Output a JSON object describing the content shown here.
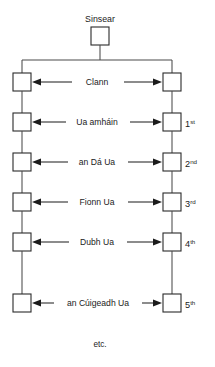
{
  "diagram": {
    "root": {
      "label": "Sinsear",
      "node_name": "ancestor-node"
    },
    "footer": {
      "label": "etc."
    },
    "colors": {
      "background": "#ffffff",
      "box_stroke": "#2a2a2a",
      "box_fill": "#ffffff",
      "connector": "#4a4a4a",
      "arrow": "#1b1b1b",
      "text": "#1b1b1b"
    },
    "rows": [
      {
        "relation": "Clann",
        "ordinal_number": "",
        "ordinal_suffix": "",
        "left_node": "left-node-clann",
        "right_node": "right-node-clann"
      },
      {
        "relation": "Ua amháin",
        "ordinal_number": "1",
        "ordinal_suffix": "st",
        "left_node": "left-node-ua-amhain",
        "right_node": "right-node-ua-amhain"
      },
      {
        "relation": "an Dá Ua",
        "ordinal_number": "2",
        "ordinal_suffix": "nd",
        "left_node": "left-node-an-da-ua",
        "right_node": "right-node-an-da-ua"
      },
      {
        "relation": "Fionn Ua",
        "ordinal_number": "3",
        "ordinal_suffix": "rd",
        "left_node": "left-node-fionn-ua",
        "right_node": "right-node-fionn-ua"
      },
      {
        "relation": "Dubh Ua",
        "ordinal_number": "4",
        "ordinal_suffix": "th",
        "left_node": "left-node-dubh-ua",
        "right_node": "right-node-dubh-ua"
      },
      {
        "relation": "an Cúigeadh Ua",
        "ordinal_number": "5",
        "ordinal_suffix": "th",
        "left_node": "left-node-an-cuigeadh-ua",
        "right_node": "right-node-an-cuigeadh-ua"
      }
    ]
  }
}
